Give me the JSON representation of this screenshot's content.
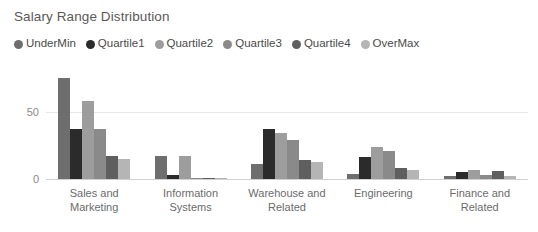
{
  "chart_data": {
    "type": "bar",
    "title": "Salary Range Distribution",
    "xlabel": "",
    "ylabel": "",
    "ylim": [
      0,
      87
    ],
    "yticks": [
      0,
      50
    ],
    "ytick_labels": [
      "0",
      "50"
    ],
    "grid": true,
    "legend_position": "top-left",
    "categories": [
      "Sales and Marketing",
      "Information Systems",
      "Warehouse and Related",
      "Engineering",
      "Finance and Related"
    ],
    "series": [
      {
        "name": "UnderMin",
        "color": "#6e6e6e",
        "values": [
          75,
          17,
          11,
          4,
          2
        ]
      },
      {
        "name": "Quartile1",
        "color": "#2b2b2b",
        "values": [
          37,
          3,
          37,
          16,
          5
        ]
      },
      {
        "name": "Quartile2",
        "color": "#9d9d9d",
        "values": [
          58,
          17,
          34,
          24,
          7
        ]
      },
      {
        "name": "Quartile3",
        "color": "#8a8a8a",
        "values": [
          37,
          1,
          29,
          21,
          3
        ]
      },
      {
        "name": "Quartile4",
        "color": "#5f5f5f",
        "values": [
          17,
          1,
          14,
          8,
          6
        ]
      },
      {
        "name": "OverMax",
        "color": "#b5b5b5",
        "values": [
          15,
          1,
          13,
          7,
          2
        ]
      }
    ]
  },
  "legend": {
    "items": [
      {
        "label": "UnderMin"
      },
      {
        "label": "Quartile1"
      },
      {
        "label": "Quartile2"
      },
      {
        "label": "Quartile3"
      },
      {
        "label": "Quartile4"
      },
      {
        "label": "OverMax"
      }
    ]
  },
  "colors": {
    "background": "#ffffff",
    "title_text": "#595959",
    "axis_text": "#8a8a8a",
    "category_text": "#6b6b6b",
    "gridline": "#e8e8e8",
    "axisline": "#d0d0d0"
  }
}
